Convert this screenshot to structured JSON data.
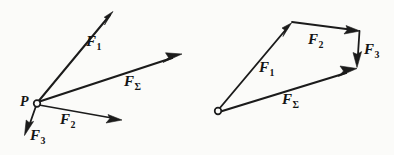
{
  "figure": {
    "background_color": "#fbfbf9",
    "ink_color": "#1b1b1b",
    "panels": [
      {
        "id": "left",
        "name": "concurrent-forces-at-point-P",
        "description": "Three force vectors F1, F2, F3 acting at point P plus resultant F-Sigma",
        "origin_label": "P",
        "origin_point": [
          37,
          103
        ],
        "vectors": [
          {
            "name": "F1",
            "label": "F",
            "subscript": "1",
            "from": [
              37,
              103
            ],
            "to": [
              113,
              12
            ],
            "label_pos": [
              86,
              34
            ]
          },
          {
            "name": "FSigma",
            "label": "F",
            "subscript": "Σ",
            "from": [
              37,
              103
            ],
            "to": [
              181,
              55
            ],
            "label_pos": [
              124,
              74
            ]
          },
          {
            "name": "F2",
            "label": "F",
            "subscript": "2",
            "from": [
              37,
              103
            ],
            "to": [
              121,
              120
            ],
            "label_pos": [
              60,
              112
            ]
          },
          {
            "name": "F3",
            "label": "F",
            "subscript": "3",
            "from": [
              37,
              103
            ],
            "to": [
              25,
              134
            ],
            "label_pos": [
              27,
              128
            ]
          }
        ]
      },
      {
        "id": "right",
        "name": "force-polygon-construction",
        "description": "Tip-to-tail vector polygon of F1, F2, F3 with closing resultant F-Sigma",
        "origin_label": "",
        "origin_point": [
          218,
          111
        ],
        "vectors": [
          {
            "name": "F1",
            "label": "F",
            "subscript": "1",
            "from": [
              218,
              111
            ],
            "to": [
              291,
              24
            ],
            "label_pos": [
              259,
              60
            ]
          },
          {
            "name": "F2",
            "label": "F",
            "subscript": "2",
            "from": [
              292,
              22
            ],
            "to": [
              359,
              31
            ],
            "label_pos": [
              311,
              31
            ]
          },
          {
            "name": "F3",
            "label": "F",
            "subscript": "3",
            "from": [
              360,
              32
            ],
            "to": [
              357,
              66
            ],
            "label_pos": [
              363,
              47
            ]
          },
          {
            "name": "FSigma",
            "label": "F",
            "subscript": "Σ",
            "from": [
              218,
              111
            ],
            "to": [
              356,
              68
            ],
            "label_pos": [
              282,
              92
            ]
          }
        ]
      }
    ]
  }
}
